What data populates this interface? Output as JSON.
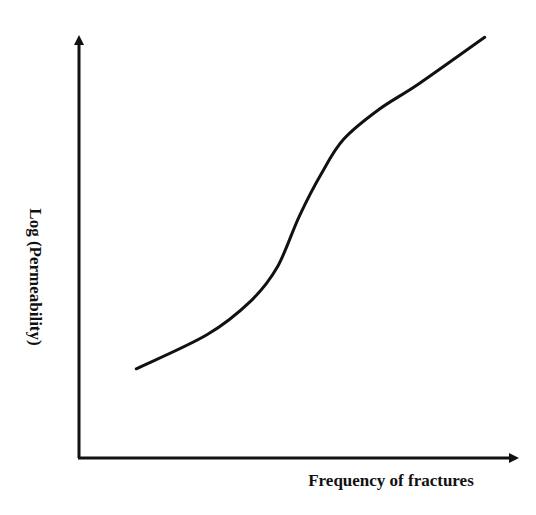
{
  "chart_data": {
    "type": "line",
    "title": "",
    "xlabel": "Frequency of fractures",
    "ylabel": "Log (Permeability)",
    "grid": false,
    "legend": null,
    "axis_ticks": "none",
    "series": [
      {
        "name": "Log (Permeability)",
        "x": [
          0.13,
          0.29,
          0.39,
          0.45,
          0.5,
          0.55,
          0.6,
          0.68,
          0.77,
          0.92
        ],
        "y": [
          0.21,
          0.29,
          0.37,
          0.45,
          0.57,
          0.67,
          0.75,
          0.82,
          0.88,
          0.99
        ]
      }
    ],
    "xlim": [
      0,
      1
    ],
    "ylim": [
      0,
      1
    ]
  },
  "colors": {
    "line": "#111111",
    "axis": "#111111",
    "background": "#ffffff"
  }
}
